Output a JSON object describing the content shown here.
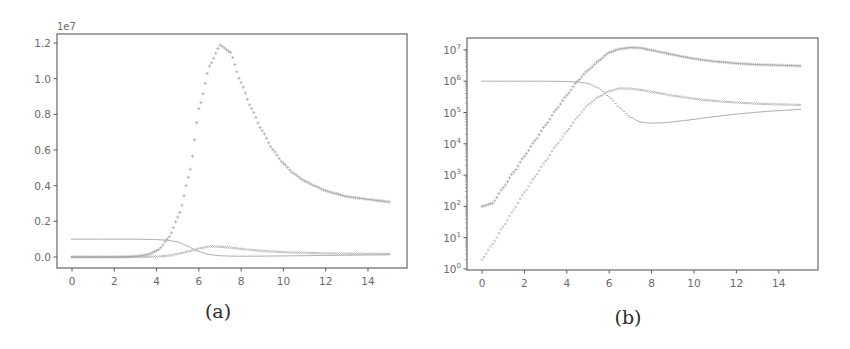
{
  "figure": {
    "captions": {
      "a": "(a)",
      "b": "(b)"
    }
  },
  "chart_data": [
    {
      "id": "a",
      "type": "scatter",
      "title": "",
      "caption": "(a)",
      "xlabel": "",
      "ylabel": "",
      "yscale": "linear",
      "y_offset_label": "1e7",
      "xlim": [
        -0.7,
        15.7
      ],
      "ylim": [
        -0.06,
        1.25
      ],
      "y_unit": 10000000,
      "xticks": [
        0,
        2,
        4,
        6,
        8,
        10,
        12,
        14
      ],
      "xtick_labels": [
        "0",
        "2",
        "4",
        "6",
        "8",
        "10",
        "12",
        "14"
      ],
      "yticks": [
        0.0,
        0.2,
        0.4,
        0.6,
        0.8,
        1.0,
        1.2
      ],
      "ytick_labels": [
        "0.0",
        "0.2",
        "0.4",
        "0.6",
        "0.8",
        "1.0",
        "1.2"
      ],
      "grid": false,
      "legend": null,
      "series_ref": "shared_series"
    },
    {
      "id": "b",
      "type": "scatter",
      "title": "",
      "caption": "(b)",
      "xlabel": "",
      "ylabel": "",
      "yscale": "log",
      "xlim": [
        -0.7,
        15.8
      ],
      "ylim_log10": [
        0,
        7.7
      ],
      "xticks": [
        0,
        2,
        4,
        6,
        8,
        10,
        12,
        14
      ],
      "xtick_labels": [
        "0",
        "2",
        "4",
        "6",
        "8",
        "10",
        "12",
        "14"
      ],
      "yticks_log10": [
        0,
        1,
        2,
        3,
        4,
        5,
        6,
        7
      ],
      "ytick_labels": [
        "10^0",
        "10^1",
        "10^2",
        "10^3",
        "10^4",
        "10^5",
        "10^6",
        "10^7"
      ],
      "grid": false,
      "legend": null,
      "series_ref": "shared_series"
    }
  ],
  "shared_series": {
    "t": [
      0,
      0.5,
      1,
      1.5,
      2,
      2.5,
      3,
      3.5,
      4,
      4.5,
      5,
      5.5,
      6,
      6.5,
      7,
      7.5,
      8,
      8.5,
      9,
      9.5,
      10,
      10.5,
      11,
      11.5,
      12,
      12.5,
      13,
      13.5,
      14,
      14.5,
      15
    ],
    "series": [
      {
        "name": "series-1-peak",
        "marker": "plus",
        "color": "#9a9a9a",
        "log10_values": [
          2.0,
          2.1,
          2.6,
          3.1,
          3.6,
          4.1,
          4.6,
          5.1,
          5.55,
          6.0,
          6.35,
          6.65,
          6.92,
          7.03,
          7.075,
          7.06,
          6.99,
          6.92,
          6.85,
          6.78,
          6.72,
          6.67,
          6.63,
          6.6,
          6.57,
          6.55,
          6.53,
          6.52,
          6.51,
          6.5,
          6.49
        ]
      },
      {
        "name": "series-2-decline",
        "marker": "line",
        "color": "#8a8a8a",
        "log10_values": [
          6.0,
          6.0,
          6.0,
          6.0,
          6.0,
          6.0,
          6.0,
          5.995,
          5.99,
          5.975,
          5.93,
          5.78,
          5.5,
          5.15,
          4.85,
          4.69,
          4.66,
          4.67,
          4.7,
          4.74,
          4.78,
          4.83,
          4.87,
          4.91,
          4.95,
          4.98,
          5.01,
          5.04,
          5.06,
          5.08,
          5.1
        ]
      },
      {
        "name": "series-3-secondary",
        "marker": "x",
        "color": "#a5a5a5",
        "log10_values": [
          0.3,
          0.8,
          1.35,
          1.9,
          2.45,
          2.95,
          3.45,
          3.95,
          4.4,
          4.85,
          5.25,
          5.5,
          5.68,
          5.77,
          5.76,
          5.72,
          5.66,
          5.6,
          5.54,
          5.49,
          5.44,
          5.4,
          5.37,
          5.34,
          5.32,
          5.3,
          5.28,
          5.27,
          5.26,
          5.25,
          5.24
        ]
      }
    ]
  },
  "layout": {
    "a": {
      "frame": [
        57,
        34,
        407,
        268
      ],
      "x0": 72,
      "x_per_unit": 21.14,
      "y0": 257,
      "y_per_unit": 178.3
    },
    "b": {
      "frame": [
        467,
        38,
        818,
        270
      ],
      "x0": 482,
      "x_per_unit": 21.2,
      "y0": 269,
      "y_per_decade": 31.3
    }
  }
}
